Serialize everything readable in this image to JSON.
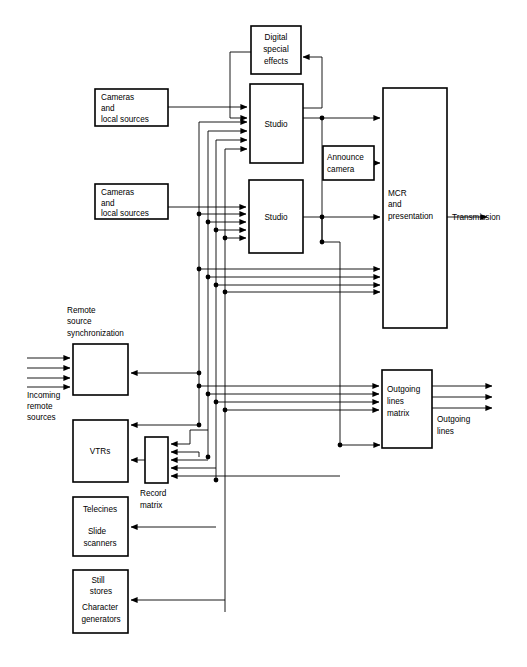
{
  "diagram": {
    "colors": {
      "line": "#000000",
      "box_fill": "#ffffff",
      "background": "#ffffff"
    },
    "boxes": [
      {
        "id": "digital_special_effects",
        "label": "Digital\nspecial\neffects",
        "lines": [
          "Digital",
          "special",
          "effects"
        ],
        "x": 251,
        "y": 26,
        "w": 50,
        "h": 48
      },
      {
        "id": "cameras_local_sources_1",
        "label": "Cameras\nand\nlocal sources",
        "lines": [
          "Cameras",
          "and",
          "local sources"
        ],
        "x": 95,
        "y": 89,
        "w": 73,
        "h": 37
      },
      {
        "id": "studio_1",
        "label": "Studio",
        "lines": [
          "Studio"
        ],
        "x": 250,
        "y": 84,
        "w": 53,
        "h": 79
      },
      {
        "id": "announce_camera",
        "label": "Announce\ncamera",
        "lines": [
          "Announce",
          "camera"
        ],
        "x": 323,
        "y": 146,
        "w": 51,
        "h": 34
      },
      {
        "id": "cameras_local_sources_2",
        "label": "Cameras\nand\nlocal sources",
        "lines": [
          "Cameras",
          "and",
          "local sources"
        ],
        "x": 95,
        "y": 184,
        "w": 73,
        "h": 35
      },
      {
        "id": "studio_2",
        "label": "Studio",
        "lines": [
          "Studio"
        ],
        "x": 249,
        "y": 180,
        "w": 54,
        "h": 73
      },
      {
        "id": "mcr_presentation",
        "label": "MCR\nand\npresentation",
        "lines": [
          "MCR",
          "and",
          "presentation"
        ],
        "x": 383,
        "y": 88,
        "w": 64,
        "h": 240
      },
      {
        "id": "remote_source_sync",
        "label": "",
        "lines": [],
        "x": 73,
        "y": 344,
        "w": 55,
        "h": 51
      },
      {
        "id": "vtrs",
        "label": "VTRs",
        "lines": [
          "VTRs"
        ],
        "x": 73,
        "y": 420,
        "w": 55,
        "h": 62
      },
      {
        "id": "record_matrix",
        "label": "",
        "lines": [],
        "x": 145,
        "y": 437,
        "w": 23,
        "h": 46
      },
      {
        "id": "telecines_slide_scanners",
        "label": "Telecines\n\nSlide\nscanners",
        "lines": [
          "Telecines",
          "Slide",
          "scanners"
        ],
        "x": 73,
        "y": 497,
        "w": 55,
        "h": 59
      },
      {
        "id": "still_stores_char_gen",
        "label": "Still\nstores\nCharacter\ngenerators",
        "lines": [
          "Still",
          "stores",
          "Character",
          "generators"
        ],
        "x": 73,
        "y": 570,
        "w": 55,
        "h": 63
      },
      {
        "id": "outgoing_lines_matrix",
        "label": "Outgoing\nlines\nmatrix",
        "lines": [
          "Outgoing",
          "lines",
          "matrix"
        ],
        "x": 382,
        "y": 370,
        "w": 50,
        "h": 78
      }
    ],
    "free_labels": [
      {
        "id": "remote-source-sync-label",
        "lines": [
          "Remote",
          "source",
          "synchronization"
        ],
        "x": 67,
        "y": 313
      },
      {
        "id": "incoming-remote-sources-label",
        "lines": [
          "Incoming",
          "remote",
          "sources"
        ],
        "x": 27,
        "y": 390
      },
      {
        "id": "record-matrix-label",
        "lines": [
          "Record",
          "matrix"
        ],
        "x": 140,
        "y": 496
      },
      {
        "id": "transmission-label",
        "lines": [
          "Transmission"
        ],
        "x": 452,
        "y": 215
      },
      {
        "id": "outgoing-lines-label",
        "lines": [
          "Outgoing",
          "lines"
        ],
        "x": 437,
        "y": 418
      }
    ]
  }
}
